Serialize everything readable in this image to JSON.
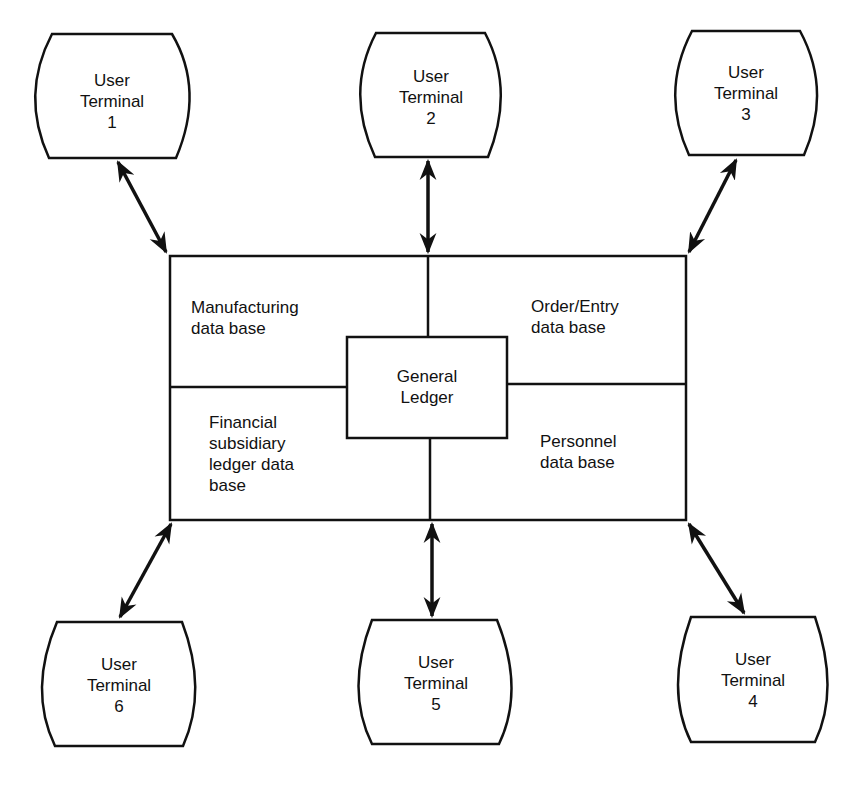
{
  "diagram": {
    "title": "",
    "colors": {
      "stroke": "#111111",
      "background": "#ffffff"
    },
    "center": {
      "label_line1": "General",
      "label_line2": "Ledger"
    },
    "databases": [
      {
        "id": "manufacturing",
        "line1": "Manufacturing",
        "line2": "data base",
        "line3": "",
        "line4": ""
      },
      {
        "id": "order-entry",
        "line1": "Order/Entry",
        "line2": "data base",
        "line3": "",
        "line4": ""
      },
      {
        "id": "financial",
        "line1": "Financial",
        "line2": "subsidiary",
        "line3": "ledger data",
        "line4": "base"
      },
      {
        "id": "personnel",
        "line1": "Personnel",
        "line2": "data base",
        "line3": "",
        "line4": ""
      }
    ],
    "terminals": [
      {
        "id": 1,
        "line1": "User",
        "line2": "Terminal",
        "line3": "1"
      },
      {
        "id": 2,
        "line1": "User",
        "line2": "Terminal",
        "line3": "2"
      },
      {
        "id": 3,
        "line1": "User",
        "line2": "Terminal",
        "line3": "3"
      },
      {
        "id": 4,
        "line1": "User",
        "line2": "Terminal",
        "line3": "4"
      },
      {
        "id": 5,
        "line1": "User",
        "line2": "Terminal",
        "line3": "5"
      },
      {
        "id": 6,
        "line1": "User",
        "line2": "Terminal",
        "line3": "6"
      }
    ],
    "connections": [
      {
        "from": "User Terminal 1",
        "to": "data base complex",
        "type": "bidirectional"
      },
      {
        "from": "User Terminal 2",
        "to": "data base complex",
        "type": "bidirectional"
      },
      {
        "from": "User Terminal 3",
        "to": "data base complex",
        "type": "bidirectional"
      },
      {
        "from": "User Terminal 4",
        "to": "data base complex",
        "type": "bidirectional"
      },
      {
        "from": "User Terminal 5",
        "to": "data base complex",
        "type": "bidirectional"
      },
      {
        "from": "User Terminal 6",
        "to": "data base complex",
        "type": "bidirectional"
      }
    ]
  }
}
